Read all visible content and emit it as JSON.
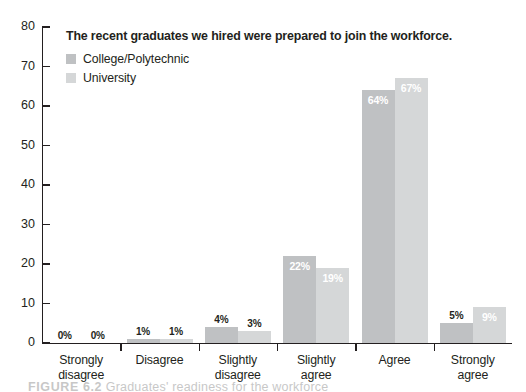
{
  "chart_data": {
    "type": "bar",
    "title": "The recent graduates we hired were prepared to join the workforce.",
    "xlabel": "",
    "ylabel": "",
    "ylim": [
      0,
      80
    ],
    "yticks": [
      0,
      10,
      20,
      30,
      40,
      50,
      60,
      70,
      80
    ],
    "grid": false,
    "legend_position": "top-left",
    "categories": [
      "Strongly disagree",
      "Disagree",
      "Slightly disagree",
      "Slightly agree",
      "Agree",
      "Strongly agree"
    ],
    "category_lines": [
      [
        "Strongly",
        "disagree"
      ],
      [
        "Disagree",
        ""
      ],
      [
        "Slightly",
        "disagree"
      ],
      [
        "Slightly",
        "agree"
      ],
      [
        "Agree",
        ""
      ],
      [
        "Strongly",
        "agree"
      ]
    ],
    "series": [
      {
        "name": "College/Polytechnic",
        "color": "#bfc1c3",
        "values": [
          0,
          1,
          4,
          22,
          64,
          5
        ],
        "labels": [
          "0%",
          "1%",
          "4%",
          "22%",
          "64%",
          "5%"
        ]
      },
      {
        "name": "University",
        "color": "#d5d7d8",
        "values": [
          0,
          1,
          3,
          19,
          67,
          9
        ],
        "labels": [
          "0%",
          "1%",
          "3%",
          "19%",
          "67%",
          "9%"
        ]
      }
    ]
  },
  "axis": {
    "y_tick_labels": [
      "80",
      "70",
      "60",
      "50",
      "40",
      "30",
      "20",
      "10",
      "0"
    ]
  },
  "legend": {
    "items": [
      {
        "label": "College/Polytechnic",
        "color": "#bfc1c3"
      },
      {
        "label": "University",
        "color": "#d5d7d8"
      }
    ]
  },
  "caption": {
    "number": "FIGURE 6.2",
    "text": "Graduates' readiness for the workforce"
  }
}
